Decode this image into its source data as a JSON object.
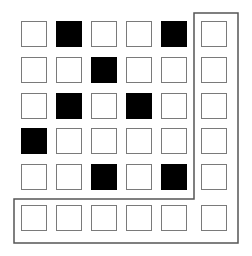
{
  "grid": {
    "rows": 6,
    "cols": 6,
    "cells": [
      [
        0,
        1,
        0,
        0,
        1,
        0
      ],
      [
        0,
        0,
        1,
        0,
        0,
        0
      ],
      [
        0,
        1,
        0,
        1,
        0,
        0
      ],
      [
        1,
        0,
        0,
        0,
        0,
        0
      ],
      [
        0,
        0,
        1,
        0,
        1,
        0
      ],
      [
        0,
        0,
        0,
        0,
        0,
        0
      ]
    ],
    "col_x": [
      21,
      56,
      91,
      126,
      161,
      201
    ],
    "row_y": [
      21,
      57,
      93,
      128,
      164,
      205
    ],
    "colors": {
      "filled": "#000000",
      "empty": "#ffffff",
      "cell_border": "#7a7a7a",
      "outline": "#555555"
    }
  },
  "outline": {
    "shape": "L-bracket",
    "points": "194,13 238,13 238,243 14,243 14,199 194,199"
  }
}
